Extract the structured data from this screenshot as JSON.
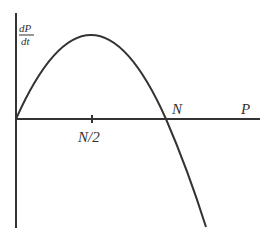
{
  "diagram": {
    "y_axis_label": {
      "numerator": "dP",
      "denominator": "dt"
    },
    "x_axis_label": "P",
    "tick_label_half": "N/2",
    "root_label": "N",
    "colors": {
      "stroke": "#333333",
      "background": "#ffffff"
    }
  }
}
